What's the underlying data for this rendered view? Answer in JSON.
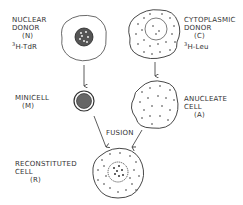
{
  "nuclear_donor": {
    "line1": "NUCLEAR",
    "line2": "DONOR",
    "code": "(N)",
    "isotope_sup": "3",
    "isotope": "H-TdR"
  },
  "cytoplasmic_donor": {
    "line1": "CYTOPLASMIC",
    "line2": "DONOR",
    "code": "(C)",
    "isotope_sup": "3",
    "isotope": "H-Leu"
  },
  "minicell": {
    "line1": "MINICELL",
    "code": "(M)"
  },
  "anucleate_cell": {
    "line1": "ANUCLEATE",
    "line2": "CELL",
    "code": "(A)"
  },
  "fusion": {
    "label": "FUSION"
  },
  "reconstituted_cell": {
    "line1": "RECONSTITUTED",
    "line2": "CELL",
    "code": "(R)"
  },
  "colors": {
    "ink": "#333333",
    "background": "#ffffff"
  }
}
